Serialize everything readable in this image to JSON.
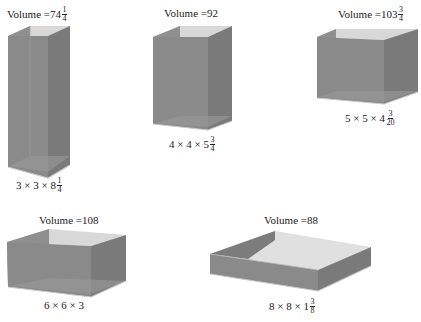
{
  "colors": {
    "front": "#8a8a8a",
    "side": "#7a7a7a",
    "back": "#a9a9a9",
    "inner_floor": "#9c9c9c",
    "top_inside": "#d8d8d8",
    "edge": "#b5b5b5",
    "base_edge": "#c8c8c8",
    "text": "#222222"
  },
  "boxes": [
    {
      "id": "box-1",
      "volume_prefix": "Volume = ",
      "volume_whole": "74",
      "volume_num": "1",
      "volume_den": "4",
      "dims_prefix": "3 × 3 × 8",
      "dims_num": "1",
      "dims_den": "4"
    },
    {
      "id": "box-2",
      "volume_prefix": "Volume = ",
      "volume_whole": "92",
      "volume_num": "",
      "volume_den": "",
      "dims_prefix": "4 × 4 × 5",
      "dims_num": "3",
      "dims_den": "4"
    },
    {
      "id": "box-3",
      "volume_prefix": "Volume = ",
      "volume_whole": "103",
      "volume_num": "3",
      "volume_den": "4",
      "dims_prefix": "5 × 5 × 4",
      "dims_num": "3",
      "dims_den": "20"
    },
    {
      "id": "box-4",
      "volume_prefix": "Volume = ",
      "volume_whole": "108",
      "volume_num": "",
      "volume_den": "",
      "dims_prefix": "6 × 6 × 3",
      "dims_num": "",
      "dims_den": ""
    },
    {
      "id": "box-5",
      "volume_prefix": "Volume = ",
      "volume_whole": "88",
      "volume_num": "",
      "volume_den": "",
      "dims_prefix": "8 × 8 × 1",
      "dims_num": "3",
      "dims_den": "8"
    }
  ]
}
